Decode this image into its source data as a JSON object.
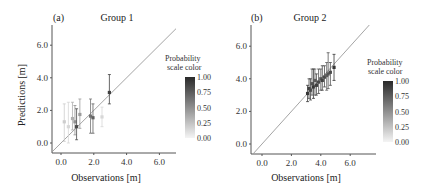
{
  "chart_data": [
    {
      "type": "scatter",
      "panel": "(a)",
      "title": "Group 1",
      "xlabel": "Observations [m]",
      "ylabel": "Predictions [m]",
      "xticks": [
        "0.0",
        "2.0",
        "4.0",
        "6.0"
      ],
      "yticks": [
        "0.0",
        "2.0",
        "4.0",
        "6.0"
      ],
      "xlim": [
        -0.5,
        7.3
      ],
      "ylim": [
        -0.6,
        7.3
      ],
      "reference_line": "y = x",
      "colorbar": {
        "title": "Probability scale color",
        "ticks": [
          "0.00",
          "0.25",
          "0.50",
          "0.75",
          "1.00"
        ],
        "range": [
          0,
          1
        ]
      },
      "points": [
        {
          "x": 0.2,
          "y": 1.3,
          "ylo": 0.1,
          "yhi": 2.4,
          "p": 0.15
        },
        {
          "x": 0.45,
          "y": 1.0,
          "ylo": 0.0,
          "yhi": 2.5,
          "p": 0.1
        },
        {
          "x": 0.7,
          "y": 1.5,
          "ylo": 0.8,
          "yhi": 2.5,
          "p": 0.3
        },
        {
          "x": 0.85,
          "y": 1.3,
          "ylo": 0.5,
          "yhi": 2.3,
          "p": 0.45
        },
        {
          "x": 0.95,
          "y": 1.0,
          "ylo": 0.2,
          "yhi": 2.1,
          "p": 0.8
        },
        {
          "x": 1.15,
          "y": 1.75,
          "ylo": 0.9,
          "yhi": 2.7,
          "p": 0.4
        },
        {
          "x": 1.8,
          "y": 1.65,
          "ylo": 0.6,
          "yhi": 2.7,
          "p": 0.6
        },
        {
          "x": 1.95,
          "y": 1.55,
          "ylo": 0.6,
          "yhi": 2.4,
          "p": 0.7
        },
        {
          "x": 2.5,
          "y": 1.6,
          "ylo": 1.0,
          "yhi": 2.2,
          "p": 0.1
        },
        {
          "x": 2.95,
          "y": 3.1,
          "ylo": 2.4,
          "yhi": 4.2,
          "p": 0.85
        }
      ]
    },
    {
      "type": "scatter",
      "panel": "(b)",
      "title": "Group 2",
      "xlabel": "Observations [m]",
      "ylabel": "Predictions [m]",
      "xticks": [
        "0.0",
        "2.0",
        "4.0",
        "6.0"
      ],
      "yticks": [
        "0.0",
        "2.0",
        "4.0",
        "6.0"
      ],
      "xlim": [
        -0.5,
        7.3
      ],
      "ylim": [
        -0.6,
        7.3
      ],
      "reference_line": "y = x",
      "colorbar": {
        "title": "Probability scale color",
        "ticks": [
          "0.00",
          "0.25",
          "0.50",
          "0.75",
          "1.00"
        ],
        "range": [
          0,
          1
        ]
      },
      "points": [
        {
          "x": 3.1,
          "y": 3.1,
          "ylo": 2.6,
          "yhi": 3.6,
          "p": 0.9
        },
        {
          "x": 3.2,
          "y": 3.4,
          "ylo": 2.8,
          "yhi": 4.0,
          "p": 0.85
        },
        {
          "x": 3.3,
          "y": 3.3,
          "ylo": 2.7,
          "yhi": 4.0,
          "p": 0.8
        },
        {
          "x": 3.4,
          "y": 3.7,
          "ylo": 3.0,
          "yhi": 4.6,
          "p": 0.75
        },
        {
          "x": 3.5,
          "y": 3.5,
          "ylo": 2.8,
          "yhi": 4.6,
          "p": 0.9
        },
        {
          "x": 3.6,
          "y": 3.9,
          "ylo": 3.0,
          "yhi": 4.6,
          "p": 0.7
        },
        {
          "x": 3.7,
          "y": 3.6,
          "ylo": 3.0,
          "yhi": 4.3,
          "p": 0.85
        },
        {
          "x": 3.85,
          "y": 3.8,
          "ylo": 3.1,
          "yhi": 4.6,
          "p": 0.8
        },
        {
          "x": 4.0,
          "y": 4.0,
          "ylo": 3.3,
          "yhi": 4.6,
          "p": 0.75
        },
        {
          "x": 4.1,
          "y": 3.9,
          "ylo": 3.3,
          "yhi": 4.8,
          "p": 0.85
        },
        {
          "x": 4.25,
          "y": 4.1,
          "ylo": 3.5,
          "yhi": 4.8,
          "p": 0.8
        },
        {
          "x": 4.4,
          "y": 4.2,
          "ylo": 3.3,
          "yhi": 5.0,
          "p": 0.7
        },
        {
          "x": 4.5,
          "y": 4.3,
          "ylo": 3.4,
          "yhi": 5.6,
          "p": 0.75
        },
        {
          "x": 4.65,
          "y": 4.4,
          "ylo": 3.6,
          "yhi": 5.0,
          "p": 0.8
        },
        {
          "x": 4.9,
          "y": 4.7,
          "ylo": 3.9,
          "yhi": 5.5,
          "p": 0.9
        }
      ]
    }
  ],
  "panels": [
    {
      "label": "(a)",
      "title": "Group 1",
      "xlabel": "Observations [m]",
      "ylabel": "Predictions [m]",
      "cb_title1": "Probability",
      "cb_title2": "scale color"
    },
    {
      "label": "(b)",
      "title": "Group 2",
      "xlabel": "Observations [m]",
      "ylabel": "",
      "cb_title1": "Probability",
      "cb_title2": "scale color"
    }
  ]
}
